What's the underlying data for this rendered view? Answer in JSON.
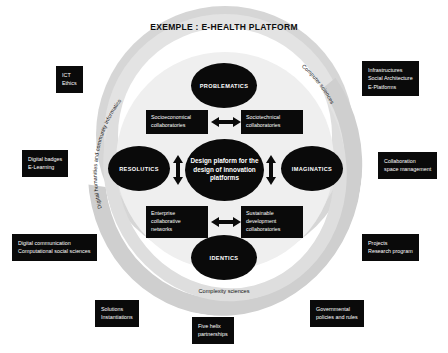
{
  "diagram": {
    "title": "EXEMPLE : E-HEALTH PLATFORM",
    "core": {
      "label": "Design plaform for the design of innovation platforms"
    },
    "nodes": {
      "top": "PROBLEMATICS",
      "left": "RESOLUTICS",
      "right": "IMAGINATICS",
      "bottom": "IDENTICS"
    },
    "inner_boxes": {
      "top_left": "Socioeconomical collaboratories",
      "top_right": "Sociotechnical collaboratories",
      "bottom_left": "Enterprise collaborative networks",
      "bottom_right": "Sustainable development collaboratories"
    },
    "arc_labels": {
      "left": "Digital humanities and community informatics",
      "right": "Computer sciences",
      "bottom": "Complexity sciences"
    },
    "outer_boxes": [
      {
        "id": "ict-ethics",
        "lines": [
          "ICT",
          "Ethics"
        ]
      },
      {
        "id": "infrastructures",
        "lines": [
          "Infrastructures",
          "Social Architecture",
          "E-Platforms"
        ]
      },
      {
        "id": "digital-badges",
        "lines": [
          "Digital badges",
          "E-Learning"
        ]
      },
      {
        "id": "collaboration-space",
        "lines": [
          "Collaboration",
          "space management"
        ]
      },
      {
        "id": "digital-communication",
        "lines": [
          "Digital communication",
          "Computational social sciences"
        ]
      },
      {
        "id": "projects",
        "lines": [
          "Projects",
          "Research program"
        ]
      },
      {
        "id": "solutions",
        "lines": [
          "Solutions",
          "Instantiations"
        ]
      },
      {
        "id": "five-helix",
        "lines": [
          "Five helix",
          "partnerships"
        ]
      },
      {
        "id": "governmental",
        "lines": [
          "Governmental",
          "policies and rules"
        ]
      }
    ],
    "colors": {
      "node_fill": "#0a0a0a",
      "node_text": "#ffffff",
      "ring_outer": "#d6d6d6",
      "ring_mid": "#e3e3e3",
      "halo": "#efefef",
      "background": "#ffffff"
    }
  }
}
